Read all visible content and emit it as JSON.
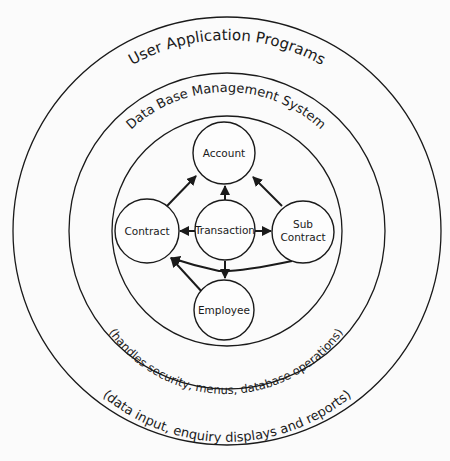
{
  "diagram": {
    "rings": {
      "outer": {
        "title": "User   Application   Programs",
        "subtitle": "(data input, enquiry displays and reports)"
      },
      "middle": {
        "title": "Data Base  Management  System",
        "subtitle": "(handles security, menus, database operations)"
      }
    },
    "nodes": {
      "account": "Account",
      "contract": "Contract",
      "transaction": "Transaction",
      "subcontract_line1": "Sub",
      "subcontract_line2": "Contract",
      "employee": "Employee"
    },
    "edges": [
      {
        "from": "Contract",
        "to": "Account"
      },
      {
        "from": "Transaction",
        "to": "Account"
      },
      {
        "from": "Sub Contract",
        "to": "Account"
      },
      {
        "from": "Transaction",
        "to": "Contract"
      },
      {
        "from": "Transaction",
        "to": "Sub Contract"
      },
      {
        "from": "Transaction",
        "to": "Employee"
      },
      {
        "from": "Employee",
        "to": "Contract"
      },
      {
        "from": "Sub Contract",
        "to": "Contract"
      }
    ]
  }
}
